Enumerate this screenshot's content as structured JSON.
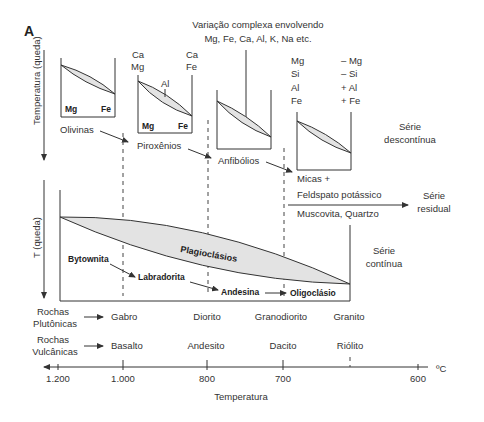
{
  "figure": {
    "panel_label": "A",
    "y_axis_top": "Temperatura  (queda)",
    "y_axis_bottom": "T (queda)",
    "top_note_line1": "Variação complexa envolvendo",
    "top_note_line2": "Mg, Fe, Ca, Al, K, Na etc.",
    "series_discontinuous_1": "Série",
    "series_discontinuous_2": "descontínua",
    "series_residual_1": "Série",
    "series_residual_2": "residual",
    "series_continuous_1": "Série",
    "series_continuous_2": "contínua"
  },
  "discontinuous": {
    "olivine_box": {
      "left_label": "Mg",
      "right_label": "Fe",
      "mineral": "Olivinas"
    },
    "pyroxene_box": {
      "top_left_1": "Ca",
      "top_left_2": "Mg",
      "top_right_1": "Ca",
      "top_right_2": "Fe",
      "al_label": "Al",
      "left_label": "Mg",
      "right_label": "Fe",
      "mineral": "Piroxênios"
    },
    "amphibole_box": {
      "mineral": "Anfibólios"
    },
    "mica_box": {
      "left_col": [
        "Mg",
        "Si",
        "Al",
        "Fe"
      ],
      "right_col": [
        "– Mg",
        "– Si",
        "+ Al",
        "+ Fe"
      ],
      "mineral_1": "Micas +",
      "mineral_2": "Feldspato potássico",
      "mineral_3": "Muscovita, Quartzo"
    }
  },
  "continuous": {
    "lens_label": "Plagioclásios",
    "minerals": [
      "Bytownita",
      "Labradorita",
      "Andesina",
      "Oligoclásio"
    ]
  },
  "rocks": {
    "plutonic_1": "Rochas",
    "plutonic_2": "Plutônicas",
    "plutonic": [
      "Gabro",
      "Diorito",
      "Granodiorito",
      "Granito"
    ],
    "volcanic_1": "Rochas",
    "volcanic_2": "Vulcânicas",
    "volcanic": [
      "Basalto",
      "Andesito",
      "Dacito",
      "Riólito"
    ]
  },
  "axis": {
    "ticks": [
      "1.200",
      "1.000",
      "800",
      "700",
      "600"
    ],
    "unit": "ºC",
    "title": "Temperatura"
  }
}
